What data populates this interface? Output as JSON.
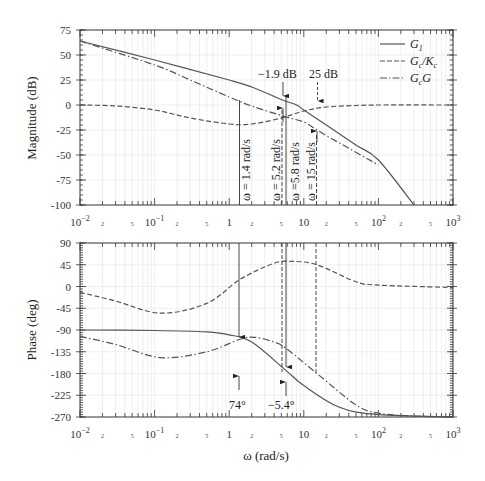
{
  "chart_data": [
    {
      "type": "line",
      "panel": "magnitude",
      "title": "",
      "xlabel": "",
      "ylabel": "Magnitude (dB)",
      "xscale": "log",
      "xlim": [
        0.01,
        1000
      ],
      "ylim": [
        -100,
        75
      ],
      "yticks": [
        75,
        50,
        25,
        0,
        -25,
        -50,
        -75,
        -100
      ],
      "xtick_labels": [
        "10^-2",
        "2",
        "5",
        "10^-1",
        "2",
        "5",
        "1",
        "2",
        "5",
        "10",
        "2",
        "5",
        "10^2",
        "2",
        "5",
        "10^3"
      ],
      "grid": true,
      "legend": {
        "position": "upper right",
        "entries": [
          "G1",
          "Gc/Kc",
          "GcG"
        ]
      },
      "series": [
        {
          "name": "G1",
          "style": "solid",
          "x": [
            0.01,
            0.1,
            1,
            2,
            5.2,
            8,
            10,
            20,
            50,
            100,
            300
          ],
          "y": [
            64,
            45,
            25,
            18,
            5,
            0,
            -5,
            -20,
            -40,
            -55,
            -100
          ]
        },
        {
          "name": "Gc/Kc",
          "style": "dashed",
          "x": [
            0.01,
            0.03,
            0.1,
            0.3,
            1,
            2,
            5,
            10,
            20,
            50,
            100,
            1000
          ],
          "y": [
            0,
            -1,
            -5,
            -13,
            -19,
            -19,
            -13,
            -6,
            -2,
            -0.5,
            0,
            0
          ]
        },
        {
          "name": "GcG",
          "style": "dash-dot",
          "x": [
            0.01,
            0.1,
            0.3,
            1,
            2,
            5.8,
            10,
            15,
            30,
            100
          ],
          "y": [
            64,
            40,
            25,
            8,
            -1,
            -12,
            -17,
            -25,
            -38,
            -60
          ]
        }
      ],
      "annotations": [
        {
          "text": "-1.9 dB",
          "x": 5.2,
          "arrow": "down"
        },
        {
          "text": "25 dB",
          "x": 15,
          "arrow": "down"
        },
        {
          "text": "ω = 1.4 rad/s",
          "x": 1.4,
          "orientation": "vertical"
        },
        {
          "text": "ω = 5.2 rad/s",
          "x": 5.2,
          "orientation": "vertical"
        },
        {
          "text": "ω = 5.8 rad/s",
          "x": 5.8,
          "orientation": "vertical"
        },
        {
          "text": "ω = 15 rad/s",
          "x": 15,
          "orientation": "vertical"
        }
      ]
    },
    {
      "type": "line",
      "panel": "phase",
      "title": "",
      "xlabel": "ω (rad/s)",
      "ylabel": "Phase (deg)",
      "xscale": "log",
      "xlim": [
        0.01,
        1000
      ],
      "ylim": [
        -270,
        90
      ],
      "yticks": [
        90,
        45,
        0,
        -45,
        -90,
        -135,
        -180,
        -225,
        -270
      ],
      "xtick_labels": [
        "10^-2",
        "2",
        "5",
        "10^-1",
        "2",
        "5",
        "1",
        "2",
        "5",
        "10",
        "2",
        "5",
        "10^2",
        "2",
        "5",
        "10^3"
      ],
      "grid": true,
      "series": [
        {
          "name": "G1",
          "style": "solid",
          "x": [
            0.01,
            0.1,
            0.5,
            1,
            2,
            5.8,
            10,
            30,
            100,
            1000
          ],
          "y": [
            -90,
            -91,
            -94,
            -100,
            -115,
            -174,
            -205,
            -250,
            -265,
            -270
          ]
        },
        {
          "name": "Gc/Kc",
          "style": "dashed",
          "x": [
            0.01,
            0.03,
            0.12,
            0.5,
            1.4,
            4,
            7,
            15,
            50,
            100,
            1000
          ],
          "y": [
            -12,
            -30,
            -55,
            -35,
            15,
            48,
            52,
            45,
            10,
            3,
            -2
          ]
        },
        {
          "name": "GcG",
          "style": "dash-dot",
          "x": [
            0.01,
            0.03,
            0.12,
            0.5,
            1.4,
            2.2,
            4,
            5.8,
            15,
            50,
            100,
            300,
            1000
          ],
          "y": [
            -103,
            -120,
            -147,
            -135,
            -109,
            -105,
            -115,
            -128,
            -180,
            -245,
            -262,
            -268,
            -270
          ]
        }
      ],
      "annotations": [
        {
          "text": "74°",
          "x": 1.4,
          "arrow": "up"
        },
        {
          "text": "-5.4°",
          "x": 5.8,
          "arrow": "up"
        }
      ]
    }
  ],
  "labels": {
    "mag_ylabel": "Magnitude (dB)",
    "phase_ylabel": "Phase (deg)",
    "xlabel": "ω (rad/s)",
    "legend_g1": "G",
    "legend_g1_sub": "1",
    "legend_gckc_a": "G",
    "legend_gckc_a_sub": "c",
    "legend_gckc_b": "/K",
    "legend_gckc_b_sub": "c",
    "legend_gcg_a": "G",
    "legend_gcg_a_sub": "c",
    "legend_gcg_b": "G",
    "ann_m19": "−1.9 dB",
    "ann_25": "25 dB",
    "ann_w14": "ω = 1.4 rad/s",
    "ann_w52": "ω = 5.2 rad/s",
    "ann_w58": "ω =5.8 rad/s",
    "ann_w15": "ω = 15 rad/s",
    "ann_74": "74°",
    "ann_m54": "−5.4°"
  },
  "mag_yticks": [
    "75",
    "50",
    "25",
    "0",
    "-25",
    "-50",
    "-75",
    "-100"
  ],
  "phase_yticks": [
    "90",
    "45",
    "0",
    "-45",
    "-90",
    "-135",
    "-180",
    "-225",
    "-270"
  ],
  "xticks_major": [
    "10",
    "10",
    "1",
    "10",
    "10",
    "10"
  ],
  "xticks_major_exp": [
    "−2",
    "−1",
    "",
    "",
    "2",
    "3"
  ],
  "xticks_minor": [
    "2",
    "5"
  ]
}
